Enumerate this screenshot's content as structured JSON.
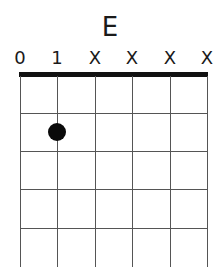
{
  "chord": {
    "name": "E",
    "string_markers": [
      "0",
      "1",
      "X",
      "X",
      "X",
      "X"
    ],
    "string_x": [
      20,
      57,
      95,
      132,
      170,
      207
    ],
    "fret_y": [
      113,
      151,
      189,
      228
    ],
    "dots": [
      {
        "string_index": 1,
        "fret": 2,
        "x": 57,
        "y": 132
      }
    ]
  }
}
